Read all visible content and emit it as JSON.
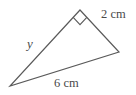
{
  "figure": {
    "type": "geometry-diagram",
    "shape": "right-triangle",
    "background_color": "#ffffff",
    "stroke_color": "#5a5a5a",
    "stroke_width": 1.2,
    "text_color": "#4a4a4a",
    "vertices": {
      "apex": {
        "x": 80,
        "y": 10
      },
      "right": {
        "x": 119,
        "y": 52
      },
      "left": {
        "x": 10,
        "y": 86
      }
    },
    "right_angle_marker": {
      "at_vertex": "apex",
      "size": 10,
      "shape": "square"
    },
    "labels": {
      "side_apex_right": "2 cm",
      "side_left_right": "6 cm",
      "side_apex_left": "y"
    }
  }
}
